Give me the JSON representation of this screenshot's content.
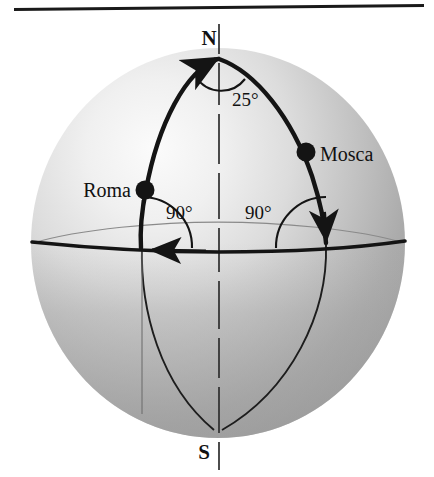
{
  "figure": {
    "poles": {
      "north_label": "N",
      "south_label": "S"
    },
    "cities": [
      {
        "name": "Roma",
        "label": "Roma"
      },
      {
        "name": "Mosca",
        "label": "Mosca"
      }
    ],
    "angles": [
      {
        "id": "apex",
        "label": "25°",
        "vertex": "north-pole"
      },
      {
        "id": "roma",
        "label": "90°",
        "vertex": "roma-meridian-equator"
      },
      {
        "id": "mosca",
        "label": "90°",
        "vertex": "mosca-meridian-equator"
      }
    ],
    "colors": {
      "sphere_light": "#f2f2f2",
      "sphere_mid": "#cfcfcf",
      "sphere_dark": "#a6a6a6",
      "sphere_shadow": "#9a9a9a",
      "ink": "#141414",
      "thin_ink": "#3a3a3a",
      "page": "#ffffff"
    },
    "elements": {
      "top_rule": "top-horizontal-rule",
      "sphere": "shaded-sphere",
      "equator": "equator-line-with-arrow",
      "polar_axis": "dashed-polar-axis",
      "meridian_roma": "thick-meridian-arc-roma",
      "meridian_mosca": "thick-meridian-arc-mosca",
      "meridian_roma_south": "thin-meridian-arc-roma-south",
      "meridian_mosca_south": "thin-meridian-arc-mosca-south",
      "equator_back": "thin-back-equator-ellipse"
    }
  }
}
